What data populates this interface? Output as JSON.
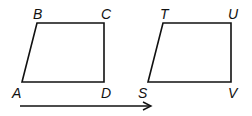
{
  "diagram": {
    "stroke_color": "#111111",
    "shapes": [
      {
        "name": "ABCD",
        "vertices": [
          {
            "label": "A",
            "x": 22,
            "y": 82
          },
          {
            "label": "B",
            "x": 37,
            "y": 23
          },
          {
            "label": "C",
            "x": 104,
            "y": 23
          },
          {
            "label": "D",
            "x": 104,
            "y": 82
          }
        ]
      },
      {
        "name": "STUV",
        "vertices": [
          {
            "label": "S",
            "x": 148,
            "y": 82
          },
          {
            "label": "T",
            "x": 163,
            "y": 23
          },
          {
            "label": "U",
            "x": 231,
            "y": 23
          },
          {
            "label": "V",
            "x": 231,
            "y": 82
          }
        ]
      }
    ],
    "labels": {
      "A": "A",
      "B": "B",
      "C": "C",
      "D": "D",
      "S": "S",
      "T": "T",
      "U": "U",
      "V": "V"
    },
    "arrow": {
      "x1": 20,
      "y1": 106,
      "x2": 152,
      "y2": 106,
      "direction": "right"
    }
  }
}
